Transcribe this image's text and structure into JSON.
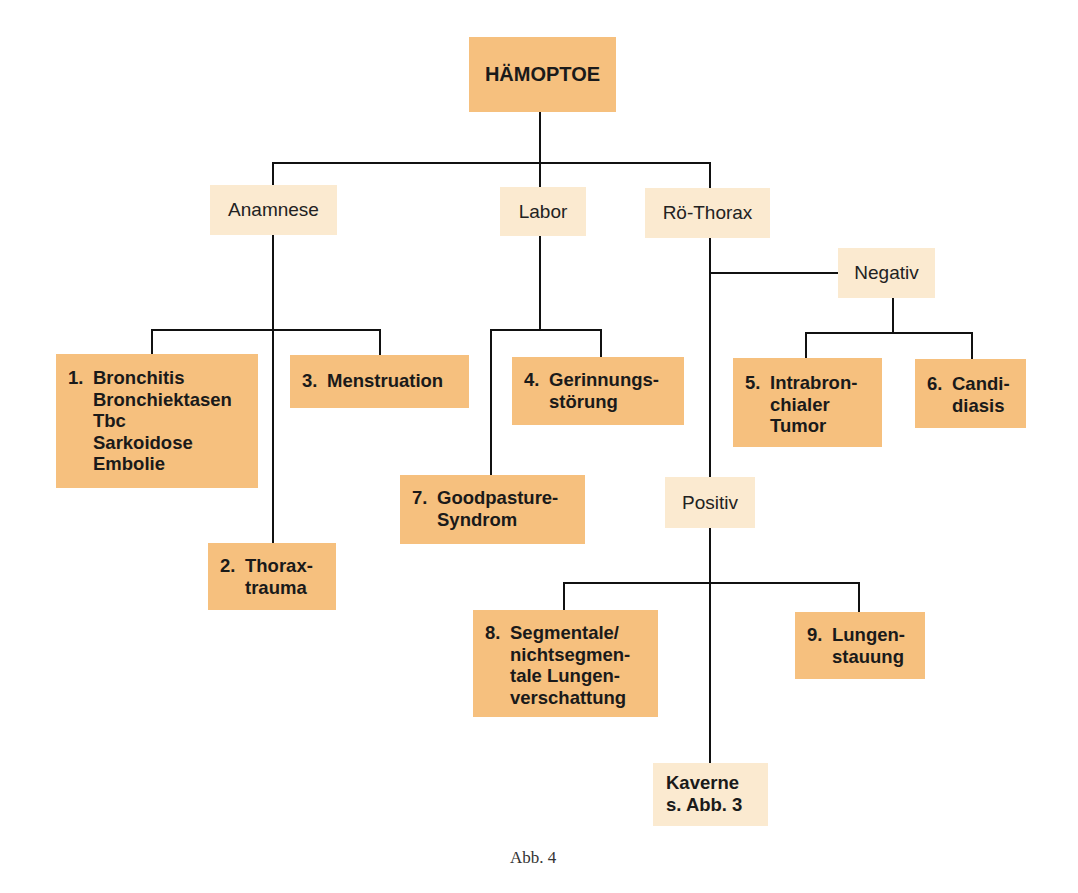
{
  "diagram": {
    "root": {
      "label": "HÄMOPTOE"
    },
    "categories": [
      {
        "id": "anamnese",
        "label": "Anamnese"
      },
      {
        "id": "labor",
        "label": "Labor"
      },
      {
        "id": "roe_thorax",
        "label": "Rö-Thorax"
      }
    ],
    "sub_categories": {
      "negativ": {
        "label": "Negativ"
      },
      "positiv": {
        "label": "Positiv"
      }
    },
    "leaves": {
      "l1": {
        "num": "1.",
        "lines": [
          "Bronchitis",
          "Bronchiektasen",
          "Tbc",
          "Sarkoidose",
          "Embolie"
        ],
        "parent": "Anamnese"
      },
      "l2": {
        "num": "2.",
        "lines": [
          "Thorax-",
          "trauma"
        ],
        "parent": "Anamnese"
      },
      "l3": {
        "num": "3.",
        "lines": [
          "Menstruation"
        ],
        "parent": "Anamnese"
      },
      "l4": {
        "num": "4.",
        "lines": [
          "Gerinnungs-",
          "störung"
        ],
        "parent": "Labor"
      },
      "l5": {
        "num": "5.",
        "lines": [
          "Intrabron-",
          "chialer",
          "Tumor"
        ],
        "parent": "Negativ"
      },
      "l6": {
        "num": "6.",
        "lines": [
          "Candi-",
          "diasis"
        ],
        "parent": "Negativ"
      },
      "l7": {
        "num": "7.",
        "lines": [
          "Goodpasture-",
          "Syndrom"
        ],
        "parent": "Labor"
      },
      "l8": {
        "num": "8.",
        "lines": [
          "Segmentale/",
          "nichtsegmen-",
          "tale Lungen-",
          "verschattung"
        ],
        "parent": "Positiv"
      },
      "l9": {
        "num": "9.",
        "lines": [
          "Lungen-",
          "stauung"
        ],
        "parent": "Positiv"
      }
    },
    "reference": {
      "lines": [
        "Kaverne",
        "s. Abb. 3"
      ],
      "parent": "Positiv"
    },
    "caption": "Abb. 4",
    "colors": {
      "primary_box": "#F6C07E",
      "secondary_box": "#FBEAD0",
      "line": "#111111"
    }
  }
}
